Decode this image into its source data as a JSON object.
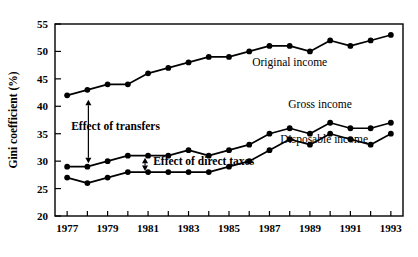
{
  "chart_data": {
    "type": "line",
    "title": "",
    "xlabel": "",
    "ylabel": "Gini coefficient (%)",
    "xlim": [
      1976.4,
      1993.6
    ],
    "ylim": [
      20,
      55
    ],
    "yticks": [
      20,
      25,
      30,
      35,
      40,
      45,
      50,
      55
    ],
    "ytick_labels": [
      "20",
      "25",
      "30",
      "35",
      "40",
      "45",
      "50",
      "55"
    ],
    "xticks": [
      1977,
      1978,
      1979,
      1980,
      1981,
      1982,
      1983,
      1984,
      1985,
      1986,
      1987,
      1988,
      1989,
      1990,
      1991,
      1992,
      1993
    ],
    "xtick_labels": [
      "1977",
      "",
      "1979",
      "",
      "1981",
      "",
      "1983",
      "",
      "1985",
      "",
      "1987",
      "",
      "1989",
      "",
      "1991",
      "",
      "1993"
    ],
    "x": [
      1977,
      1978,
      1979,
      1980,
      1981,
      1982,
      1983,
      1984,
      1985,
      1986,
      1987,
      1988,
      1989,
      1990,
      1991,
      1992,
      1993
    ],
    "grid": false,
    "legend_position": "inline-annotation",
    "series": [
      {
        "name": "Original income",
        "label": "Original income",
        "values": [
          42,
          43,
          44,
          44,
          46,
          47,
          48,
          49,
          49,
          50,
          51,
          51,
          50,
          52,
          51,
          52,
          53
        ],
        "label_x": 1988.0,
        "label_y": 47.4
      },
      {
        "name": "Gross income",
        "label": "Gross income",
        "values": [
          29,
          29,
          30,
          31,
          31,
          31,
          32,
          31,
          32,
          33,
          35,
          36,
          35,
          37,
          36,
          36,
          37
        ],
        "label_x": 1989.5,
        "label_y": 39.7
      },
      {
        "name": "Disposable income",
        "label": "Disposable income",
        "values": [
          27,
          26,
          27,
          28,
          28,
          28,
          28,
          28,
          29,
          30,
          32,
          34,
          33,
          35,
          34,
          33,
          35
        ],
        "label_x": 1989.7,
        "label_y": 33.3
      }
    ],
    "annotations": [
      {
        "text": "Effect of transfers",
        "kind": "double-arrow-vertical",
        "arrow_x": 1978.05,
        "arrow_y_top": 41.2,
        "arrow_y_bottom": 29.6,
        "text_x": 1977.2,
        "text_y": 35.6
      },
      {
        "text": "Effect of direct taxes",
        "kind": "double-arrow-vertical",
        "arrow_x": 1980.85,
        "arrow_y_top": 30.6,
        "arrow_y_bottom": 28.2,
        "text_x": 1981.25,
        "text_y": 29.3
      }
    ]
  }
}
